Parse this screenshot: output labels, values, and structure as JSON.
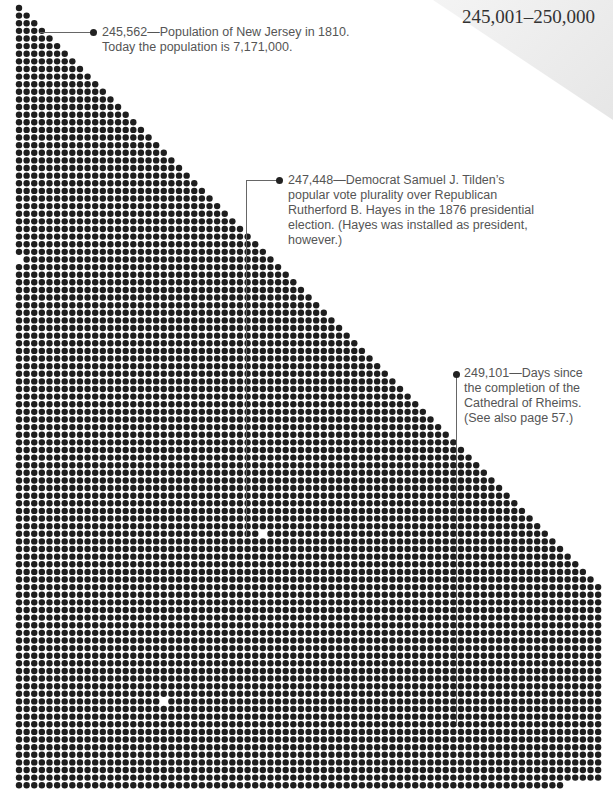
{
  "header": {
    "range_title": "245,001–250,000"
  },
  "grid": {
    "start": 245001,
    "end": 250000,
    "columns": 77,
    "pitch": 7.62,
    "dot_diameter": 6.4,
    "origin_x": 19,
    "origin_y": 8,
    "dot_color": "#1e1e1e",
    "highlight_color": "#ffffff"
  },
  "annotations": [
    {
      "number": 245562,
      "text_line1": "245,562—Population of New Jersey in 1810.",
      "text_line2": "Today the population is 7,171,000."
    },
    {
      "number": 247448,
      "text_line1": "247,448—Democrat Samuel J. Tilden’s",
      "text_line2": "popular vote plurality over Republican",
      "text_line3": "Rutherford B. Hayes in the 1876 presidential",
      "text_line4": "election. (Hayes was installed as president,",
      "text_line5": "however.)"
    },
    {
      "number": 249101,
      "text_line1": "249,101—Days since",
      "text_line2": "the completion of the",
      "text_line3": "Cathedral of Rheims.",
      "text_line4": "(See also page 57.)"
    }
  ]
}
